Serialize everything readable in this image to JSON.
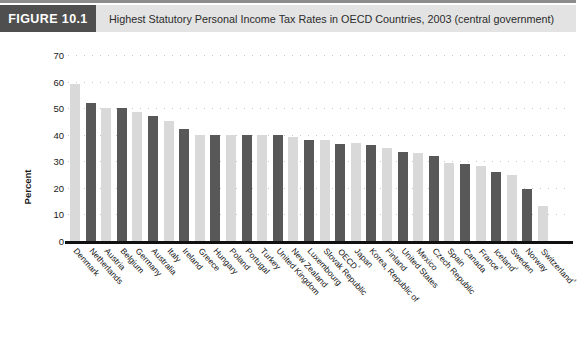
{
  "header": {
    "badge": "FIGURE 10.1",
    "title": "Highest Statutory Personal Income Tax Rates in OECD Countries, 2003 (central government)"
  },
  "colors": {
    "badge_background": "#4f4f4f",
    "header_background": "#e3e3e3",
    "bar_light": "#d9d9d9",
    "bar_dark": "#585858",
    "axis": "#111111",
    "gridline": "#c9c9c9"
  },
  "chart_data": {
    "type": "bar",
    "title": "Highest Statutory Personal Income Tax Rates in OECD Countries, 2003 (central government)",
    "xlabel": "",
    "ylabel": "Percent",
    "ylim": [
      0,
      70
    ],
    "yticks": [
      0,
      10,
      20,
      30,
      40,
      50,
      60,
      70
    ],
    "grid": true,
    "legend": false,
    "categories": [
      "Denmark",
      "Netherlands",
      "Austria",
      "Belgium",
      "Germany",
      "Australia",
      "Italy",
      "Ireland",
      "Greece",
      "Hungary",
      "Poland",
      "Portugal",
      "Turkey",
      "United Kingdom",
      "New Zealand",
      "Luxembourg",
      "Slovak Republic",
      "OECD⁴",
      "Japan",
      "Korea, Republic of",
      "Finland",
      "United States",
      "Mexico",
      "Czech Republic",
      "Spain",
      "Canada",
      "France¹",
      "Iceland²",
      "Sweden",
      "Norway",
      "Switzerland³"
    ],
    "values": [
      59,
      52,
      50,
      50,
      48.5,
      47,
      45,
      42,
      40,
      40,
      40,
      40,
      40,
      40,
      39,
      38,
      38,
      36.5,
      37,
      36,
      35,
      33.5,
      33,
      32,
      29.2,
      29,
      28.3,
      26.1,
      25,
      19.5,
      13.2
    ]
  }
}
